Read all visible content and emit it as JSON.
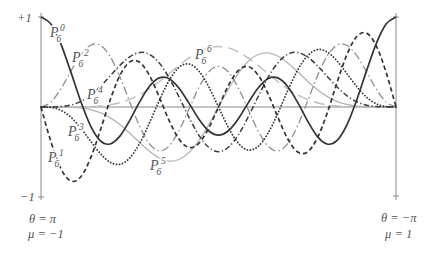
{
  "figure": {
    "y_axis": {
      "top_label": "+1",
      "bottom_label": "−1"
    },
    "x_axis": {
      "left_line1": "θ = π",
      "left_line2": "μ = −1",
      "right_line1": "θ = −π",
      "right_line2": "μ = 1"
    }
  },
  "chart_data": {
    "type": "line",
    "title": "",
    "xlabel": "",
    "ylabel": "",
    "x_end_labels": {
      "left": [
        "θ = π",
        "μ = −1"
      ],
      "right": [
        "θ = −π",
        "μ = 1"
      ]
    },
    "y_tick_labels": [
      "+1",
      "−1"
    ],
    "ylim": [
      -1,
      1
    ],
    "xlim": [
      0,
      1
    ],
    "grid": false,
    "legend": "inline labels next to curves",
    "x": [
      0,
      0.0278,
      0.0556,
      0.0833,
      0.1111,
      0.1389,
      0.1667,
      0.1944,
      0.2222,
      0.25,
      0.2778,
      0.3056,
      0.3333,
      0.3611,
      0.3889,
      0.4167,
      0.4444,
      0.4722,
      0.5,
      0.5278,
      0.5556,
      0.5833,
      0.6111,
      0.6389,
      0.6667,
      0.6944,
      0.7222,
      0.75,
      0.7778,
      0.8056,
      0.8333,
      0.8611,
      0.8889,
      0.9167,
      0.9444,
      0.9722,
      1
    ],
    "series": [
      {
        "name": "P6^0",
        "label": {
          "base": "P",
          "sub": "6",
          "sup": "0"
        },
        "color": "#333333",
        "line_style": "ls-solid",
        "values": [
          1.0,
          0.9216,
          0.7045,
          0.3983,
          0.0719,
          -0.2039,
          -0.374,
          -0.4114,
          -0.3236,
          -0.1484,
          0.0564,
          0.2299,
          0.3232,
          0.3138,
          0.2089,
          0.0431,
          -0.1321,
          -0.2638,
          -0.3125,
          -0.2638,
          -0.1321,
          0.0431,
          0.2089,
          0.3138,
          0.3232,
          0.2299,
          0.0564,
          -0.1484,
          -0.3236,
          -0.4114,
          -0.374,
          -0.2039,
          0.0719,
          0.3983,
          0.7045,
          0.9216,
          1.0
        ]
      },
      {
        "name": "P6^1",
        "label": {
          "base": "P",
          "sub": "6",
          "sup": "1"
        },
        "color": "#333333",
        "line_style": "ls-dashed",
        "values": [
          0,
          -0.3844,
          -0.6802,
          -0.8215,
          -0.7806,
          -0.5753,
          -0.2636,
          0.0732,
          0.35,
          0.5012,
          0.4967,
          0.3493,
          0.1085,
          -0.1525,
          -0.3576,
          -0.4494,
          -0.4041,
          -0.2374,
          0,
          0.2374,
          0.4041,
          0.4494,
          0.3576,
          0.1525,
          -0.1085,
          -0.3493,
          -0.4967,
          -0.5012,
          -0.35,
          -0.0732,
          0.2636,
          0.5753,
          0.7806,
          0.8215,
          0.6802,
          0.3844,
          0
        ]
      },
      {
        "name": "P6^2",
        "label": {
          "base": "P",
          "sub": "6",
          "sup": "2"
        },
        "color": "#8a8a8a",
        "line_style": "ls-dashdot-light",
        "values": [
          0,
          0.0538,
          0.1991,
          0.3923,
          0.5741,
          0.6858,
          0.6864,
          0.5632,
          0.337,
          0.0566,
          -0.2134,
          -0.4102,
          -0.4882,
          -0.4322,
          -0.2615,
          -0.0244,
          0.214,
          0.3888,
          0.4529,
          0.3888,
          0.214,
          -0.0244,
          -0.2615,
          -0.4322,
          -0.4882,
          -0.4102,
          -0.2134,
          0.0566,
          0.337,
          0.5632,
          0.6864,
          0.6858,
          0.5741,
          0.3923,
          0.1991,
          0.0538,
          0
        ]
      },
      {
        "name": "P6^3",
        "label": {
          "base": "P",
          "sub": "6",
          "sup": "3"
        },
        "color": "#333333",
        "line_style": "ls-dotted",
        "values": [
          0,
          -0.0047,
          -0.0358,
          -0.1102,
          -0.2286,
          -0.374,
          -0.5147,
          -0.6134,
          -0.6367,
          -0.5661,
          -0.4043,
          -0.1767,
          0.0735,
          0.295,
          0.4404,
          0.4781,
          0.4009,
          0.2276,
          0,
          -0.2276,
          -0.4009,
          -0.4781,
          -0.4404,
          -0.295,
          -0.0735,
          0.1767,
          0.4043,
          0.5661,
          0.6367,
          0.6134,
          0.5147,
          0.374,
          0.2286,
          0.1102,
          0.0358,
          0.0047,
          0
        ]
      },
      {
        "name": "P6^4",
        "label": {
          "base": "P",
          "sub": "6",
          "sup": "4"
        },
        "color": "#3a3a3a",
        "line_style": "ls-dashdot",
        "values": [
          0,
          0.0003,
          0.0044,
          0.0206,
          0.0591,
          0.1272,
          0.2248,
          0.3426,
          0.462,
          0.5581,
          0.6056,
          0.585,
          0.4883,
          0.3229,
          0.1109,
          -0.1136,
          -0.3118,
          -0.4477,
          -0.4961,
          -0.4477,
          -0.3118,
          -0.1136,
          0.1109,
          0.3229,
          0.4883,
          0.585,
          0.6056,
          0.5581,
          0.462,
          0.3426,
          0.2248,
          0.1272,
          0.0591,
          0.0206,
          0.0044,
          0.0003,
          0
        ]
      },
      {
        "name": "P6^5",
        "label": {
          "base": "P",
          "sub": "6",
          "sup": "5"
        },
        "color": "#b5b5b5",
        "line_style": "ls-solid-light",
        "values": [
          0,
          0,
          -0.0004,
          -0.0026,
          -0.0102,
          -0.0284,
          -0.063,
          -0.1183,
          -0.1956,
          -0.2909,
          -0.3945,
          -0.4922,
          -0.5667,
          -0.6013,
          -0.5831,
          -0.5064,
          -0.3743,
          -0.199,
          0,
          0.199,
          0.3743,
          0.5064,
          0.5831,
          0.6013,
          0.5667,
          0.4922,
          0.3945,
          0.2909,
          0.1956,
          0.1183,
          0.063,
          0.0284,
          0.0102,
          0.0026,
          0.0004,
          0,
          0
        ]
      },
      {
        "name": "P6^6",
        "label": {
          "base": "P",
          "sub": "6",
          "sup": "6"
        },
        "color": "#bdbdbd",
        "line_style": "ls-longdash-light",
        "values": [
          0,
          0,
          0,
          0.0002,
          0.0011,
          0.0038,
          0.0105,
          0.0239,
          0.0474,
          0.084,
          0.1357,
          0.2029,
          0.2834,
          0.3722,
          0.4625,
          0.5455,
          0.6128,
          0.6565,
          0.6717,
          0.6565,
          0.6128,
          0.5455,
          0.4625,
          0.3722,
          0.2834,
          0.2029,
          0.1357,
          0.084,
          0.0474,
          0.0239,
          0.0105,
          0.0038,
          0.0011,
          0.0002,
          0,
          0,
          0
        ]
      }
    ]
  }
}
